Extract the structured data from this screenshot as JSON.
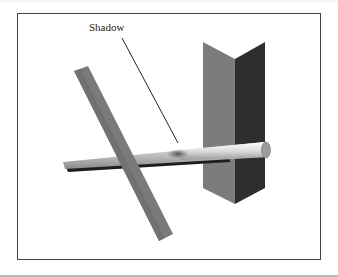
{
  "figure": {
    "annotation_label": "Shadow",
    "objects": [
      {
        "name": "diagonal-rod",
        "color": "#7a7a7a"
      },
      {
        "name": "horizontal-rod",
        "color": "#c8c8c8"
      },
      {
        "name": "folded-panel-left-face",
        "color": "#7c7c7c"
      },
      {
        "name": "folded-panel-right-face",
        "color": "#2e2e2e"
      },
      {
        "name": "cast-shadow",
        "color": "#555555"
      }
    ],
    "colors": {
      "frame_border": "#444444",
      "background": "#ffffff",
      "leader_line": "#222222"
    }
  }
}
